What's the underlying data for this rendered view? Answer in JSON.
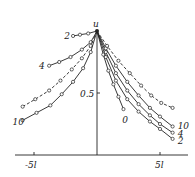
{
  "chart_data": {
    "type": "line",
    "title": "",
    "xlabel": "",
    "ylabel": "u",
    "x_ticks": [
      "-5l",
      "5l"
    ],
    "y_ticks": [
      "0.5"
    ],
    "xlim": [
      -7.5,
      6.0
    ],
    "ylim": [
      0,
      1.0
    ],
    "grid": false,
    "series": [
      {
        "name": "2 (left)",
        "style": "solid",
        "x": [
          -1.9,
          -1.35,
          -0.7,
          0
        ],
        "y": [
          0.96,
          0.97,
          0.98,
          1.0
        ]
      },
      {
        "name": "4 (left)",
        "style": "solid",
        "x": [
          -3.8,
          -3.0,
          -2.1,
          -1.2,
          -0.5,
          0
        ],
        "y": [
          0.72,
          0.75,
          0.79,
          0.85,
          0.91,
          1.0
        ]
      },
      {
        "name": "dashed (left)",
        "style": "dashed",
        "x": [
          -5.9,
          -4.9,
          -3.8,
          -2.9,
          -2.0,
          -1.2,
          -0.5,
          0
        ],
        "y": [
          0.39,
          0.45,
          0.52,
          0.6,
          0.69,
          0.78,
          0.88,
          1.0
        ]
      },
      {
        "name": "10 (left)",
        "style": "solid",
        "x": [
          -5.9,
          -4.8,
          -3.7,
          -2.8,
          -1.9,
          -1.1,
          -0.5,
          0
        ],
        "y": [
          0.28,
          0.34,
          0.4,
          0.49,
          0.59,
          0.7,
          0.83,
          1.0
        ]
      },
      {
        "name": "0",
        "style": "solid",
        "x": [
          0,
          0.5,
          0.9,
          1.3,
          1.7,
          2.1
        ],
        "y": [
          1.0,
          0.81,
          0.68,
          0.57,
          0.47,
          0.37
        ]
      },
      {
        "name": "2",
        "style": "solid",
        "x": [
          0,
          0.7,
          1.5,
          2.4,
          3.3,
          4.2,
          5.0,
          6.0
        ],
        "y": [
          1.0,
          0.79,
          0.6,
          0.45,
          0.35,
          0.27,
          0.21,
          0.13
        ]
      },
      {
        "name": "4",
        "style": "solid",
        "x": [
          0,
          0.7,
          1.5,
          2.4,
          3.3,
          4.2,
          5.0,
          6.0
        ],
        "y": [
          1.0,
          0.83,
          0.66,
          0.52,
          0.41,
          0.32,
          0.25,
          0.18
        ]
      },
      {
        "name": "10",
        "style": "solid",
        "x": [
          0,
          0.7,
          1.5,
          2.4,
          3.3,
          4.2,
          5.0,
          6.0
        ],
        "y": [
          1.0,
          0.86,
          0.72,
          0.59,
          0.48,
          0.38,
          0.31,
          0.23
        ]
      },
      {
        "name": "dashed (right)",
        "style": "dashed",
        "x": [
          0,
          0.8,
          1.7,
          2.6,
          3.5,
          4.3,
          5.1,
          6.0
        ],
        "y": [
          1.0,
          0.88,
          0.76,
          0.66,
          0.56,
          0.48,
          0.42,
          0.38
        ]
      }
    ],
    "curve_labels": [
      {
        "text": "2",
        "x": -2.6,
        "y": 0.96
      },
      {
        "text": "4",
        "x": -4.6,
        "y": 0.72
      },
      {
        "text": "10",
        "x": -6.7,
        "y": 0.27
      },
      {
        "text": "0",
        "x": 2.0,
        "y": 0.28
      },
      {
        "text": "10",
        "x": 6.4,
        "y": 0.23
      },
      {
        "text": "4",
        "x": 6.4,
        "y": 0.17
      },
      {
        "text": "2",
        "x": 6.4,
        "y": 0.11
      }
    ]
  }
}
